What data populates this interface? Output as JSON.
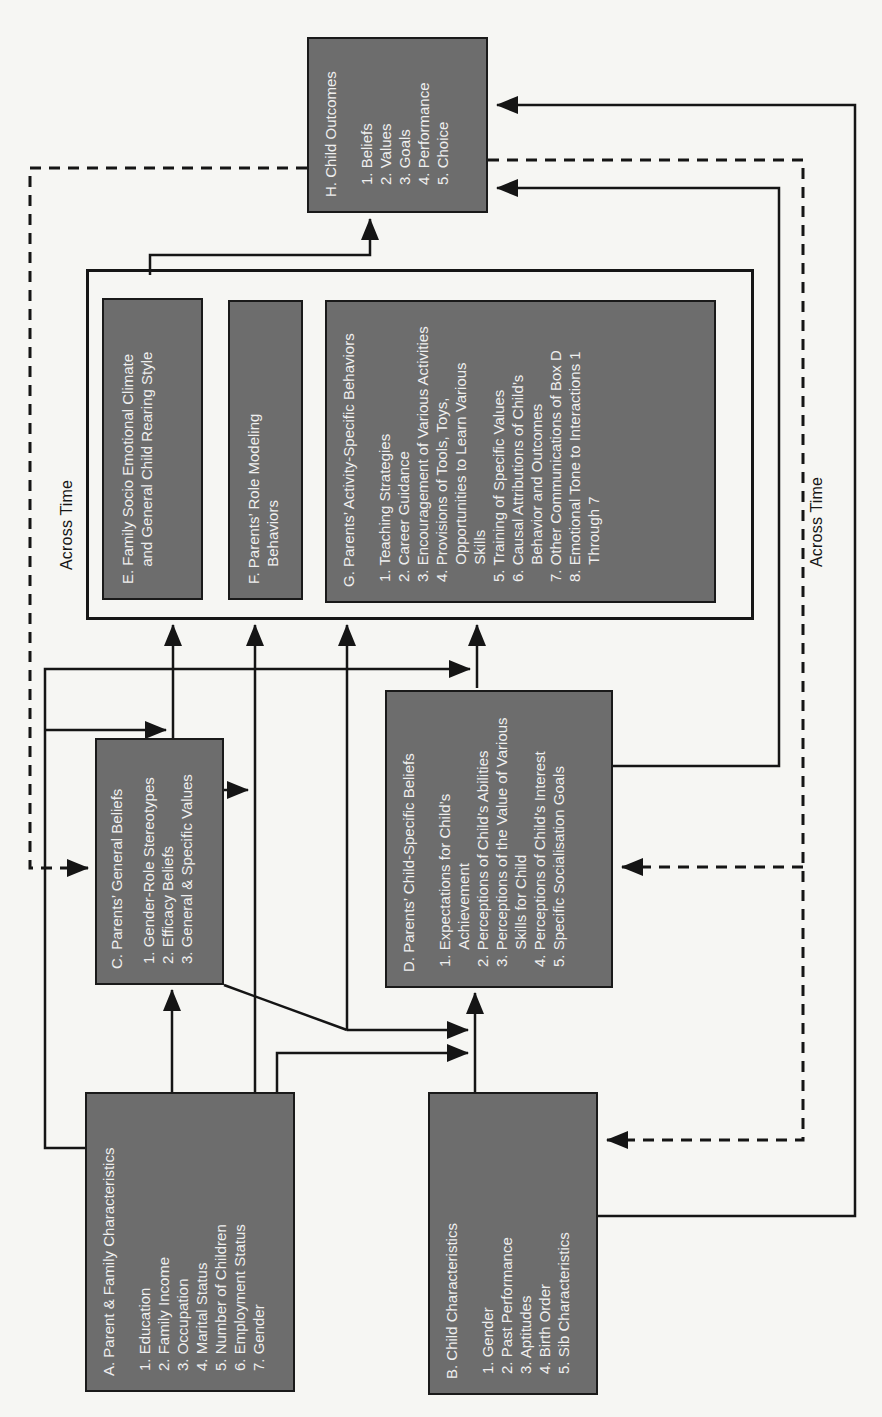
{
  "page": {
    "background": "#f6f6f3"
  },
  "colors": {
    "box_fill": "#6d6d6d",
    "box_text": "#efefef",
    "line": "#151515"
  },
  "labels": {
    "across_time_top": "Across Time",
    "across_time_bottom": "Across Time"
  },
  "boxes": {
    "a": {
      "title": "A. Parent & Family Characteristics",
      "items": [
        "1. Education",
        "2. Family Income",
        "3. Occupation",
        "4. Marital Status",
        "5. Number of Children",
        "6. Employment Status",
        "7. Gender"
      ]
    },
    "b": {
      "title": "B. Child Characteristics",
      "items": [
        "1. Gender",
        "2. Past Performance",
        "3. Aptitudes",
        "4. Birth Order",
        "5. Sib Characteristics"
      ]
    },
    "c": {
      "title": "C. Parents’ General Beliefs",
      "items": [
        "1. Gender-Role Stereotypes",
        "2. Efficacy Beliefs",
        "3. General & Specific Values"
      ]
    },
    "d": {
      "title": "D. Parents’ Child-Specific Beliefs",
      "items": [
        "1. Expectations for Child’s Achievement",
        "2. Perceptions of Child’s Abilities",
        "3. Perceptions of the Value of Various Skills for Child",
        "4. Perceptions of Child’s Interest",
        "5. Specific Socialisation Goals"
      ]
    },
    "e": {
      "title": "E. Family Socio Emotional Climate and General Child Rearing Style"
    },
    "f": {
      "title": "F. Parents’ Role Modeling Behaviors"
    },
    "g": {
      "title": "G. Parents’ Activity-Specific Behaviors",
      "items": [
        "1. Teaching Strategies",
        "2. Career Guidance",
        "3. Encouragement of Various Activities",
        "4. Provisions of Tools, Toys, Opportunities to Learn Various Skills",
        "5. Training of Specific Values",
        "6. Causal Attributions of Child’s Behavior and Outcomes",
        "7. Other Communications of Box D",
        "8. Emotional Tone to Interactions 1 Through 7"
      ]
    },
    "h": {
      "title": "H. Child Outcomes",
      "items": [
        "1. Beliefs",
        "2. Values",
        "3. Goals",
        "4. Performance",
        "5. Choice"
      ]
    }
  }
}
